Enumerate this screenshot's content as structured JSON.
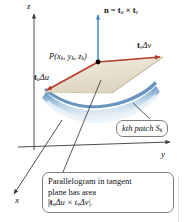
{
  "figure": {
    "background": "#ffffff"
  },
  "axes": {
    "z_label": "z",
    "y_label": "y",
    "x_label": "x",
    "color": "#3a3a3a"
  },
  "labels": {
    "normal": "n = t",
    "normal_sub1": "u",
    "normal_times": " × t",
    "normal_sub2": "v",
    "tangent_v": "t",
    "tangent_v_sub": "v",
    "tangent_v_delta": "Δv",
    "tangent_u": "t",
    "tangent_u_sub": "u",
    "tangent_u_delta": "Δu",
    "point": "P(x",
    "point_sub1": "k",
    "point_mid1": ", y",
    "point_sub2": "k",
    "point_mid2": ", z",
    "point_sub3": "k",
    "point_end": ")"
  },
  "callouts": {
    "patch": {
      "prefix": "kth patch S",
      "sub": "k"
    },
    "area": {
      "line1": "Parallelogram in tangent",
      "line2": "plane has area",
      "line3_open": "|t",
      "line3_sub1": "u",
      "line3_du": "Δu × t",
      "line3_sub2": "v",
      "line3_dv": "Δv|."
    }
  },
  "colors": {
    "normal_vector": "#3b87c4",
    "tangent_vector": "#b83a2a",
    "parallelogram_fill": "#e8e2d3",
    "parallelogram_edge": "#b8ac93",
    "surface_patch_top": "#6c9bc8",
    "surface_patch_mid": "#a9c5de",
    "surface_patch_light": "#dce8f3",
    "axis": "#3a3a3a",
    "callout_border": "#7d7d7d",
    "point_dot": "#000000"
  },
  "geometry": {
    "origin": {
      "x": 34,
      "y": 147
    },
    "z_axis_top": {
      "x": 34,
      "y": 12
    },
    "y_axis_end": {
      "x": 172,
      "y": 142
    },
    "x_axis_end": {
      "x": 12,
      "y": 196
    },
    "point_P": {
      "x": 98,
      "y": 62
    },
    "normal_tip": {
      "x": 98,
      "y": 13
    },
    "tangent_v_tip": {
      "x": 163,
      "y": 57
    },
    "tangent_u_tip": {
      "x": 44,
      "y": 92
    },
    "parallelogram": [
      {
        "x": 98,
        "y": 62
      },
      {
        "x": 163,
        "y": 57
      },
      {
        "x": 112,
        "y": 92
      },
      {
        "x": 44,
        "y": 92
      }
    ]
  }
}
